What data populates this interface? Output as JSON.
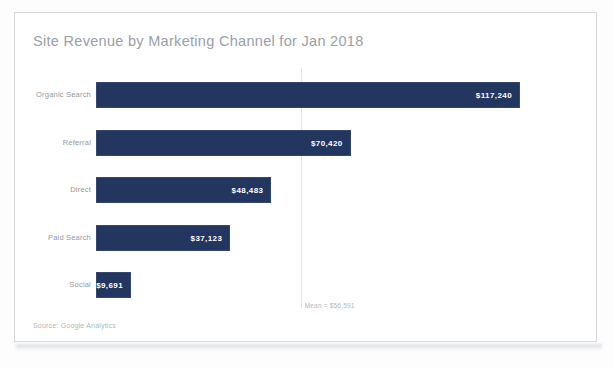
{
  "card": {
    "title": "Site Revenue by Marketing Channel for Jan 2018",
    "source_note": "Source: Google Analytics",
    "bar_color": "#22365f",
    "title_color": "#9aa0aa",
    "background": "#ffffff",
    "border_color": "#d8d8dc"
  },
  "chart_data": {
    "type": "bar",
    "orientation": "horizontal",
    "title": "Site Revenue by Marketing Channel for Jan 2018",
    "xlabel": "",
    "ylabel": "",
    "categories": [
      "Organic Search",
      "Referral",
      "Direct",
      "Paid Search",
      "Social"
    ],
    "values": [
      117240,
      70420,
      48483,
      37123,
      9691
    ],
    "value_labels": [
      "$117,240",
      "$70,420",
      "$48,483",
      "$37,123",
      "$9,691"
    ],
    "xlim": [
      0,
      125000
    ],
    "grid": false,
    "legend": false,
    "annotations": [
      {
        "name": "mean-reference-line",
        "label": "Mean = $56,591",
        "value": 56591
      }
    ],
    "series": [
      {
        "name": "Site Revenue",
        "values": [
          117240,
          70420,
          48483,
          37123,
          9691
        ],
        "color": "#22365f"
      }
    ]
  }
}
